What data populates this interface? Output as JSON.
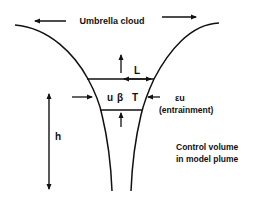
{
  "diagram": {
    "type": "volcanic plume schematic",
    "labels": {
      "umbrella_cloud": "Umbrella cloud",
      "length": "L",
      "velocity": "u",
      "beta": "β",
      "temperature": "T",
      "entrainment_symbol": "εu",
      "entrainment_text": "(entrainment)",
      "height": "h",
      "control_volume_line1": "Control volume",
      "control_volume_line2": "in model plume"
    },
    "colors": {
      "stroke": "#111111",
      "background": "#ffffff"
    },
    "elements": [
      {
        "id": "left-plume-boundary",
        "kind": "curve"
      },
      {
        "id": "right-plume-boundary",
        "kind": "curve"
      },
      {
        "id": "control-volume-top",
        "kind": "line"
      },
      {
        "id": "control-volume-bottom",
        "kind": "line"
      },
      {
        "id": "umbrella-arrow-left",
        "kind": "arrow",
        "direction": "left"
      },
      {
        "id": "umbrella-arrow-right",
        "kind": "arrow",
        "direction": "right"
      },
      {
        "id": "length-arrow",
        "kind": "double-arrow",
        "label": "L"
      },
      {
        "id": "upward-flux-top",
        "kind": "arrow",
        "direction": "up"
      },
      {
        "id": "upward-flux-bottom",
        "kind": "arrow",
        "direction": "up"
      },
      {
        "id": "entrainment-arrow-left",
        "kind": "arrow",
        "direction": "right"
      },
      {
        "id": "entrainment-arrow-right",
        "kind": "arrow",
        "direction": "left"
      },
      {
        "id": "height-arrow",
        "kind": "double-arrow",
        "label": "h"
      }
    ]
  }
}
